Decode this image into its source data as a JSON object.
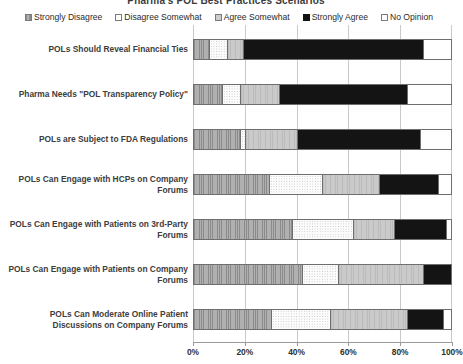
{
  "chart": {
    "title": "Pharma's POL Best Practices Scenarios",
    "legend_position": "top",
    "grid": true
  },
  "legend": {
    "items": [
      {
        "label": "Strongly Disagree",
        "key": "strongly_disagree",
        "icon": "legend-swatch-hatched",
        "color": "#b0b0b0"
      },
      {
        "label": "Disagree Somewhat",
        "key": "disagree_somewhat",
        "icon": "legend-swatch-dotted",
        "color": "#fcfcfc"
      },
      {
        "label": "Agree Somewhat",
        "key": "agree_somewhat",
        "icon": "legend-swatch-light",
        "color": "#cacaca"
      },
      {
        "label": "Strongly Agree",
        "key": "strongly_agree",
        "icon": "legend-swatch-solid",
        "color": "#141414"
      },
      {
        "label": "No Opinion",
        "key": "no_opinion",
        "icon": "legend-swatch-empty",
        "color": "#ffffff"
      }
    ]
  },
  "xaxis": {
    "label": "",
    "ticks": [
      "0%",
      "20%",
      "40%",
      "60%",
      "80%",
      "100%"
    ],
    "min": 0,
    "max": 100
  },
  "chart_data": {
    "type": "bar",
    "orientation": "horizontal",
    "stacked": true,
    "stack_mode": "percent",
    "title": "Pharma's POL Best Practices Scenarios",
    "xlabel": "",
    "ylabel": "",
    "xlim": [
      0,
      100
    ],
    "grid": true,
    "legend_position": "top",
    "categories": [
      "POLs Should Reveal Financial Ties",
      "Pharma Needs \"POL Transparency Policy\"",
      "POLs are Subject to FDA Regulations",
      "POLs Can Engage with HCPs on Company Forums",
      "POLs Can Engage with Patients on 3rd-Party Forums",
      "POLs Can Engage with Patients on Company Forums",
      "POLs Can Moderate Online Patient Discussions on Company Forums"
    ],
    "series": [
      {
        "name": "Strongly Disagree",
        "values": [
          6,
          11,
          18,
          29,
          38,
          42,
          30
        ]
      },
      {
        "name": "Disagree Somewhat",
        "values": [
          7,
          7,
          2,
          21,
          24,
          14,
          23
        ]
      },
      {
        "name": "Agree Somewhat",
        "values": [
          6,
          15,
          20,
          22,
          16,
          33,
          30
        ]
      },
      {
        "name": "Strongly Agree",
        "values": [
          70,
          50,
          48,
          23,
          20,
          11,
          14
        ]
      },
      {
        "name": "No Opinion",
        "values": [
          11,
          17,
          12,
          5,
          2,
          0,
          3
        ]
      }
    ]
  }
}
